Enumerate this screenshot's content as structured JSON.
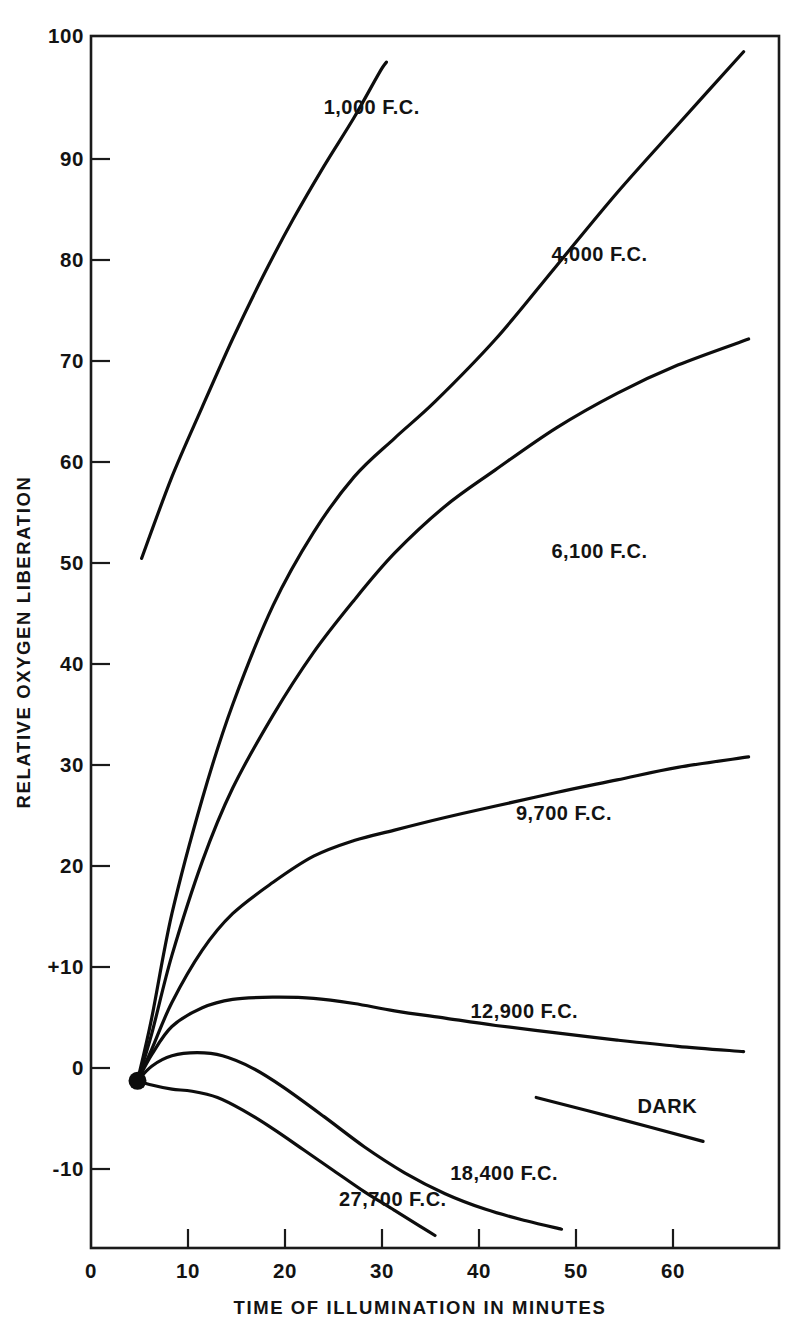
{
  "chart_data": {
    "type": "line",
    "title": "",
    "xlabel": "TIME OF ILLUMINATION IN MINUTES",
    "ylabel": "RELATIVE OXYGEN LIBERATION",
    "xlim": [
      0,
      68
    ],
    "ylim": [
      -16,
      100
    ],
    "grid": false,
    "legend_position": "inline-curve-labels",
    "xticks": [
      0,
      10,
      20,
      30,
      40,
      50,
      60
    ],
    "xtick_labels": [
      "0",
      "10",
      "20",
      "30",
      "40",
      "50",
      "60"
    ],
    "yticks": [
      -10,
      0,
      10,
      20,
      30,
      40,
      50,
      60,
      70,
      80,
      90,
      100
    ],
    "ytick_labels": [
      "-10",
      "0",
      "+10",
      "20",
      "30",
      "40",
      "50",
      "60",
      "70",
      "80",
      "90",
      "100"
    ],
    "origin_marker": {
      "x": 4.6,
      "y": 0,
      "style": "filled-circle"
    },
    "series": [
      {
        "name": "1,000 F.C.",
        "label": "1,000 F.C.",
        "label_x": 23.0,
        "label_y": 92.5,
        "points": [
          [
            4.6,
            0.0
          ],
          [
            5.0,
            50.0
          ],
          [
            8.0,
            57.8
          ],
          [
            11.0,
            64.5
          ],
          [
            14.0,
            71.0
          ],
          [
            17.0,
            77.0
          ],
          [
            20.0,
            82.5
          ],
          [
            23.0,
            87.5
          ],
          [
            26.0,
            92.2
          ],
          [
            28.5,
            96.5
          ],
          [
            29.2,
            97.5
          ]
        ],
        "visible_from_x": 5.0,
        "note": "drawn starting near y=50 at x=5"
      },
      {
        "name": "4,000 F.C.",
        "label": "4,000 F.C.",
        "label_x": 45.5,
        "label_y": 78.5,
        "points": [
          [
            4.6,
            0.0
          ],
          [
            6.0,
            6.0
          ],
          [
            8.0,
            16.0
          ],
          [
            11.0,
            27.0
          ],
          [
            14.0,
            36.0
          ],
          [
            18.0,
            45.5
          ],
          [
            22.0,
            52.5
          ],
          [
            26.0,
            57.8
          ],
          [
            30.0,
            61.5
          ],
          [
            34.0,
            65.0
          ],
          [
            40.0,
            71.0
          ],
          [
            46.0,
            78.0
          ],
          [
            52.0,
            85.0
          ],
          [
            58.0,
            91.5
          ],
          [
            64.5,
            98.5
          ]
        ]
      },
      {
        "name": "6,100 F.C.",
        "label": "6,100 F.C.",
        "label_x": 45.5,
        "label_y": 50.0,
        "points": [
          [
            4.6,
            0.0
          ],
          [
            6.0,
            4.5
          ],
          [
            8.0,
            12.0
          ],
          [
            11.0,
            21.0
          ],
          [
            14.0,
            28.0
          ],
          [
            18.0,
            35.0
          ],
          [
            22.0,
            41.0
          ],
          [
            26.0,
            46.0
          ],
          [
            30.0,
            50.5
          ],
          [
            35.0,
            55.0
          ],
          [
            40.0,
            58.5
          ],
          [
            46.0,
            62.5
          ],
          [
            52.0,
            65.8
          ],
          [
            58.0,
            68.5
          ],
          [
            65.0,
            71.0
          ]
        ]
      },
      {
        "name": "9,700 F.C.",
        "label": "9,700 F.C.",
        "label_x": 42.0,
        "label_y": 25.0,
        "points": [
          [
            4.6,
            0.0
          ],
          [
            6.0,
            3.0
          ],
          [
            8.0,
            7.5
          ],
          [
            11.0,
            12.5
          ],
          [
            14.0,
            16.0
          ],
          [
            18.0,
            19.0
          ],
          [
            22.0,
            21.5
          ],
          [
            26.0,
            23.0
          ],
          [
            30.0,
            24.0
          ],
          [
            35.0,
            25.2
          ],
          [
            40.0,
            26.3
          ],
          [
            46.0,
            27.6
          ],
          [
            52.0,
            28.8
          ],
          [
            58.0,
            30.0
          ],
          [
            65.0,
            31.0
          ]
        ]
      },
      {
        "name": "12,900 F.C.",
        "label": "12,900 F.C.",
        "label_x": 37.5,
        "label_y": 6.0,
        "points": [
          [
            4.6,
            0.0
          ],
          [
            6.0,
            2.5
          ],
          [
            8.0,
            5.2
          ],
          [
            11.0,
            7.0
          ],
          [
            14.0,
            7.8
          ],
          [
            18.0,
            8.0
          ],
          [
            22.0,
            7.9
          ],
          [
            26.0,
            7.4
          ],
          [
            30.0,
            6.7
          ],
          [
            35.0,
            6.0
          ],
          [
            40.0,
            5.3
          ],
          [
            46.0,
            4.6
          ],
          [
            52.0,
            3.9
          ],
          [
            58.0,
            3.3
          ],
          [
            64.5,
            2.8
          ]
        ]
      },
      {
        "name": "18,400 F.C.",
        "label": "18,400 F.C.",
        "label_x": 35.5,
        "label_y": -9.5,
        "points": [
          [
            4.6,
            0.0
          ],
          [
            6.0,
            1.4
          ],
          [
            8.0,
            2.4
          ],
          [
            10.5,
            2.7
          ],
          [
            13.0,
            2.4
          ],
          [
            16.0,
            1.2
          ],
          [
            19.0,
            -0.6
          ],
          [
            23.0,
            -3.4
          ],
          [
            27.0,
            -6.3
          ],
          [
            31.0,
            -8.8
          ],
          [
            35.0,
            -10.8
          ],
          [
            39.0,
            -12.3
          ],
          [
            43.0,
            -13.4
          ],
          [
            46.5,
            -14.2
          ]
        ]
      },
      {
        "name": "27,700 F.C.",
        "label": "27,700 F.C.",
        "label_x": 24.5,
        "label_y": -12.0,
        "points": [
          [
            4.6,
            0.0
          ],
          [
            6.0,
            -0.4
          ],
          [
            8.0,
            -0.8
          ],
          [
            10.0,
            -1.0
          ],
          [
            12.5,
            -1.6
          ],
          [
            15.0,
            -2.8
          ],
          [
            18.0,
            -4.6
          ],
          [
            21.0,
            -6.6
          ],
          [
            24.0,
            -8.6
          ],
          [
            27.0,
            -10.6
          ],
          [
            30.0,
            -12.4
          ],
          [
            32.5,
            -13.9
          ],
          [
            34.0,
            -14.8
          ]
        ]
      },
      {
        "name": "DARK",
        "label": "DARK",
        "label_x": 54.0,
        "label_y": -3.1,
        "points": [
          [
            44.0,
            -1.6
          ],
          [
            52.0,
            -3.6
          ],
          [
            60.5,
            -5.8
          ]
        ],
        "note": "short detached segment at lower right"
      }
    ]
  }
}
